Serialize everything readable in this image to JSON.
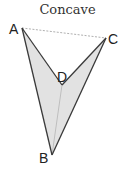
{
  "title": "Concave",
  "shape": {
    "type": "concave-quadrilateral",
    "fill": "#e2e2e2",
    "stroke": "#3a3a3a",
    "vertices": {
      "A": {
        "label": "A",
        "x": 22,
        "y": 28
      },
      "C": {
        "label": "C",
        "x": 106,
        "y": 38
      },
      "D": {
        "label": "D",
        "x": 62,
        "y": 85
      },
      "B": {
        "label": "B",
        "x": 52,
        "y": 155
      }
    },
    "dashed_segment": [
      "A",
      "C"
    ],
    "diagonal_segment": [
      "D",
      "B"
    ]
  }
}
